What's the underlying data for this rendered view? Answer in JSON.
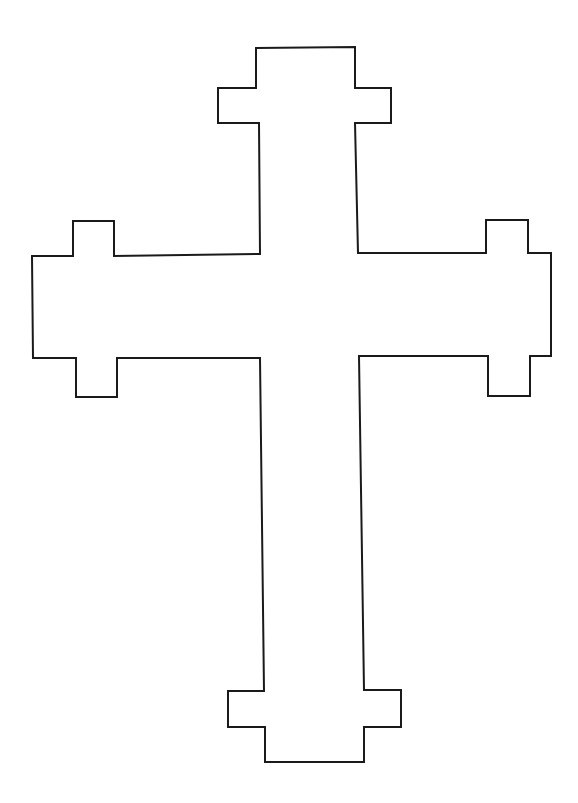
{
  "figure": {
    "stroke_color": "#1a1a1a",
    "fill_color": "#ffffff",
    "background": "#ffffff",
    "outline_points": [
      [
        256,
        48
      ],
      [
        355,
        47
      ],
      [
        355,
        88
      ],
      [
        391,
        88
      ],
      [
        391,
        123
      ],
      [
        355,
        123
      ],
      [
        358,
        253
      ],
      [
        486,
        253
      ],
      [
        486,
        220
      ],
      [
        528,
        220
      ],
      [
        528,
        253
      ],
      [
        551,
        253
      ],
      [
        551,
        356
      ],
      [
        530,
        356
      ],
      [
        530,
        396
      ],
      [
        488,
        396
      ],
      [
        488,
        356
      ],
      [
        359,
        356
      ],
      [
        364,
        690
      ],
      [
        401,
        690
      ],
      [
        401,
        727
      ],
      [
        364,
        727
      ],
      [
        364,
        762
      ],
      [
        265,
        762
      ],
      [
        265,
        727
      ],
      [
        228,
        727
      ],
      [
        228,
        691
      ],
      [
        264,
        691
      ],
      [
        260,
        358
      ],
      [
        117,
        358
      ],
      [
        117,
        397
      ],
      [
        76,
        397
      ],
      [
        76,
        358
      ],
      [
        33,
        358
      ],
      [
        32,
        256
      ],
      [
        73,
        256
      ],
      [
        73,
        221
      ],
      [
        114,
        221
      ],
      [
        114,
        256
      ],
      [
        260,
        254
      ],
      [
        259,
        123
      ],
      [
        218,
        123
      ],
      [
        218,
        88
      ],
      [
        256,
        88
      ]
    ]
  }
}
